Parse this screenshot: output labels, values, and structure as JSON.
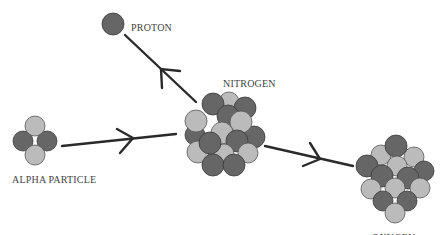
{
  "diagram": {
    "labels": {
      "proton": "PROTON",
      "nitrogen": "NITROGEN",
      "alpha": "ALPHA PARTICLE",
      "oxygen": "OXYGEN"
    },
    "colors": {
      "proton_dark": "#666666",
      "neutron_light": "#bbbbbb",
      "arrow": "#2a2a2a"
    }
  }
}
